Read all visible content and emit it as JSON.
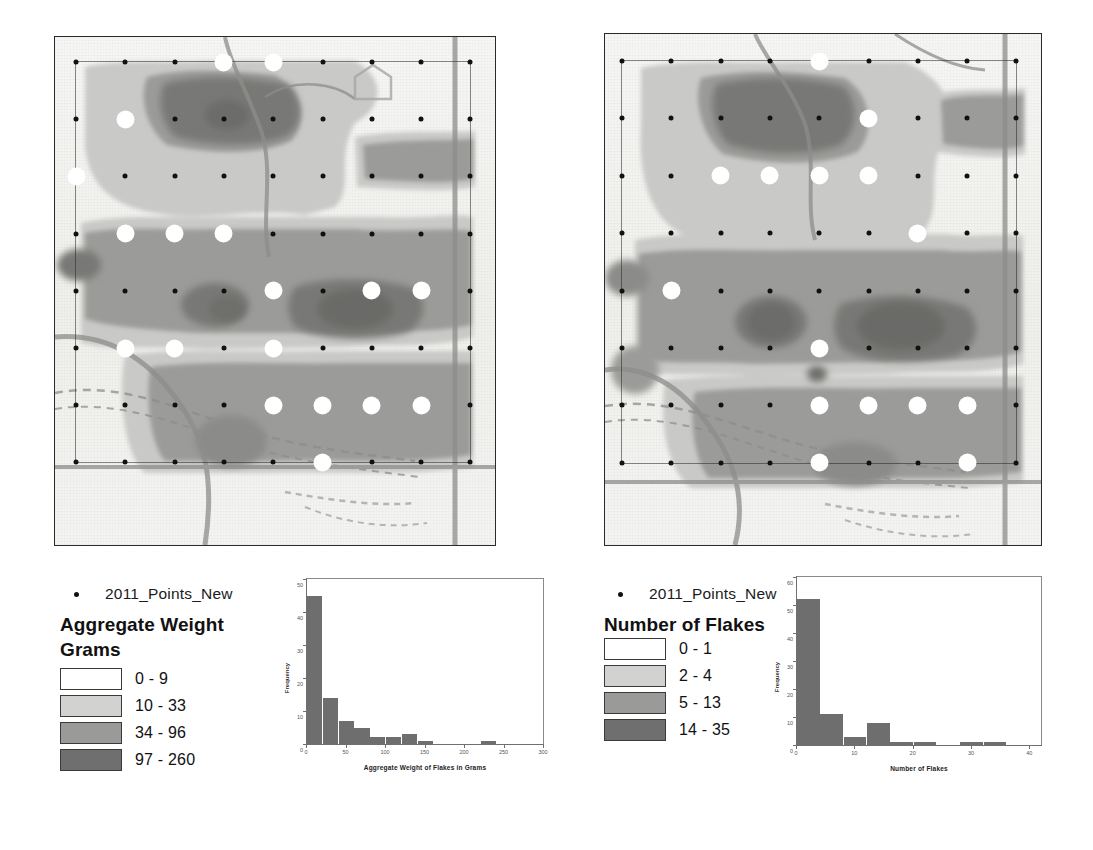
{
  "maps": {
    "left": {
      "name": "aggregate-weight-map",
      "points_rows": 8,
      "points_cols": 9
    },
    "right": {
      "name": "number-of-flakes-map",
      "points_rows": 8,
      "points_cols": 9
    }
  },
  "legends": [
    {
      "id": "left",
      "point_layer_label": "2011_Points_New",
      "title": "Aggregate Weight",
      "subtitle": "Grams",
      "classes": [
        {
          "label": "0 - 9",
          "color": "#ffffff"
        },
        {
          "label": "10 - 33",
          "color": "#d2d2d0"
        },
        {
          "label": "34 - 96",
          "color": "#9a9a99"
        },
        {
          "label": "97 - 260",
          "color": "#6f6f6f"
        }
      ]
    },
    {
      "id": "right",
      "point_layer_label": "2011_Points_New",
      "title": "Number of Flakes",
      "subtitle": "",
      "classes": [
        {
          "label": "0 - 1",
          "color": "#ffffff"
        },
        {
          "label": "2 - 4",
          "color": "#d2d2d0"
        },
        {
          "label": "5 - 13",
          "color": "#9a9a99"
        },
        {
          "label": "14 - 35",
          "color": "#6f6f6f"
        }
      ]
    }
  ],
  "chart_data": [
    {
      "id": "hist-weight",
      "type": "bar",
      "title": "",
      "xlabel": "Aggregate Weight of Flakes in Grams",
      "ylabel": "Frequency",
      "xlim": [
        0,
        300
      ],
      "ylim": [
        0,
        50
      ],
      "xticks": [
        0,
        50,
        100,
        150,
        200,
        250,
        300
      ],
      "yticks": [
        0,
        10,
        20,
        30,
        40,
        50
      ],
      "grid": false,
      "bar_color": "#6e6e6e",
      "bin_width": 20,
      "bin_starts": [
        0,
        20,
        40,
        60,
        80,
        100,
        120,
        140,
        160,
        180,
        200,
        220,
        240
      ],
      "values": [
        45,
        14,
        7,
        5,
        2,
        2,
        3,
        1,
        0,
        0,
        0,
        1,
        0
      ]
    },
    {
      "id": "hist-flakes",
      "type": "bar",
      "title": "",
      "xlabel": "Number of Flakes",
      "ylabel": "Frequency",
      "xlim": [
        0,
        42
      ],
      "ylim": [
        0,
        60
      ],
      "xticks": [
        0,
        10,
        20,
        30,
        40
      ],
      "yticks": [
        0,
        10,
        20,
        30,
        40,
        50,
        60
      ],
      "grid": false,
      "bar_color": "#6e6e6e",
      "bin_width": 4,
      "bin_starts": [
        0,
        4,
        8,
        12,
        16,
        20,
        24,
        28,
        32,
        36
      ],
      "values": [
        52,
        11,
        3,
        8,
        1,
        1,
        0,
        1,
        1,
        0
      ]
    }
  ]
}
